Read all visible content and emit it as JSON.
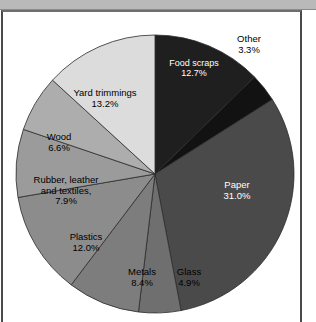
{
  "window": {
    "toolbar_ghost_text": "",
    "frame_name": "figure-frame"
  },
  "chart_data": {
    "type": "pie",
    "title": "",
    "subtitle": "",
    "xlabel": "",
    "ylabel": "",
    "legend_position": "none",
    "grid": false,
    "total_percent": 100.0,
    "start_angle_deg": 0,
    "direction": "clockwise",
    "categories": [
      "Food scraps",
      "Other",
      "Paper",
      "Glass",
      "Metals",
      "Plastics",
      "Rubber, leather and textiles,",
      "Wood",
      "Yard trimmings"
    ],
    "values": [
      12.7,
      3.3,
      31.0,
      4.9,
      8.4,
      12.0,
      7.9,
      6.6,
      13.2
    ],
    "slices": [
      {
        "name": "Food scraps",
        "label_lines": [
          "Food scraps",
          "12.7%"
        ],
        "value": 12.7,
        "value_label": "12.7%",
        "color": "#1f1f1f",
        "label_color": "#ffffff",
        "label_x": 148,
        "label_y": 46,
        "label_width": 86,
        "font_size": 9
      },
      {
        "name": "Other",
        "label_lines": [
          "Other",
          "3.3%"
        ],
        "value": 3.3,
        "value_label": "3.3%",
        "color": "#121212",
        "label_color": "#000000",
        "label_x": 216,
        "label_y": 22,
        "label_width": 60,
        "font_size": 9.5
      },
      {
        "name": "Paper",
        "label_lines": [
          "Paper",
          "31.0%"
        ],
        "value": 31.0,
        "value_label": "31.0%",
        "color": "#4a4a4a",
        "label_color": "#ffffff",
        "label_x": 203,
        "label_y": 168,
        "label_width": 62,
        "font_size": 9.5
      },
      {
        "name": "Glass",
        "label_lines": [
          "Glass",
          "4.9%"
        ],
        "value": 4.9,
        "value_label": "4.9%",
        "color": "#6f6f6f",
        "label_color": "#000000",
        "label_x": 164,
        "label_y": 255,
        "label_width": 44,
        "font_size": 9.5
      },
      {
        "name": "Metals",
        "label_lines": [
          "Metals",
          "8.4%"
        ],
        "value": 8.4,
        "value_label": "8.4%",
        "color": "#7d7d7d",
        "label_color": "#000000",
        "label_x": 116,
        "label_y": 255,
        "label_width": 46,
        "font_size": 9.5
      },
      {
        "name": "Plastics",
        "label_lines": [
          "Plastics",
          "12.0%"
        ],
        "value": 12.0,
        "value_label": "12.0%",
        "color": "#8c8c8c",
        "label_color": "#000000",
        "label_x": 54,
        "label_y": 220,
        "label_width": 58,
        "font_size": 9.5
      },
      {
        "name": "Rubber, leather and textiles,",
        "label_lines": [
          "Rubber, leather",
          "and textiles,",
          "7.9%"
        ],
        "value": 7.9,
        "value_label": "7.9%",
        "color": "#9b9b9b",
        "label_color": "#000000",
        "label_x": 16,
        "label_y": 163,
        "label_width": 94,
        "font_size": 9.5
      },
      {
        "name": "Wood",
        "label_lines": [
          "Wood",
          "6.6%"
        ],
        "value": 6.6,
        "value_label": "6.6%",
        "color": "#adadad",
        "label_color": "#000000",
        "label_x": 32,
        "label_y": 120,
        "label_width": 48,
        "font_size": 9.5
      },
      {
        "name": "Yard trimmings",
        "label_lines": [
          "Yard trimmings",
          "13.2%"
        ],
        "value": 13.2,
        "value_label": "13.2%",
        "color": "#dcdcdc",
        "label_color": "#000000",
        "label_x": 58,
        "label_y": 76,
        "label_width": 88,
        "font_size": 9.5
      }
    ],
    "geometry": {
      "center_x": 152,
      "center_y": 162,
      "radius": 139,
      "stroke_color": "#2b2b2b",
      "stroke_width": 0.8
    }
  }
}
